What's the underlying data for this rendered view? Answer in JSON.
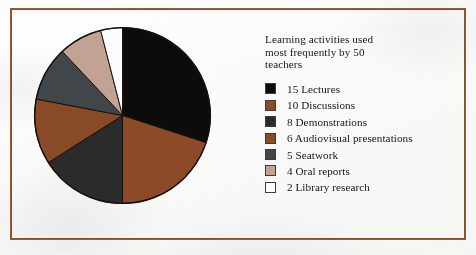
{
  "figure": {
    "frame_color": "#9a5a34",
    "page_background": "#fdfdfc"
  },
  "legend": {
    "title": "Learning activities used\nmost frequently by 50\nteachers"
  },
  "chart_data": {
    "type": "pie",
    "title": "Learning activities used most frequently by 50 teachers",
    "xlabel": "",
    "ylabel": "",
    "total": 50,
    "units": "teachers",
    "start_angle_deg": 0,
    "direction": "clockwise",
    "legend_position": "right",
    "grid": false,
    "categories": [
      "Lectures",
      "Discussions",
      "Demonstrations",
      "Audiovisual presentations",
      "Seatwork",
      "Oral reports",
      "Library research"
    ],
    "values": [
      15,
      10,
      8,
      6,
      5,
      4,
      2
    ],
    "colors": [
      "#0d0c0b",
      "#8d4a27",
      "#2b2b2c",
      "#8a4a27",
      "#41464a",
      "#c3a394",
      "#fdfdfb"
    ],
    "slices": [
      {
        "label": "Lectures",
        "value": 15,
        "legend_label": "15 Lectures",
        "color": "#0d0c0b",
        "percent": 30,
        "angle_deg": 108.0
      },
      {
        "label": "Discussions",
        "value": 10,
        "legend_label": "10  Discussions",
        "color": "#8d4a27",
        "percent": 20,
        "angle_deg": 72.0
      },
      {
        "label": "Demonstrations",
        "value": 8,
        "legend_label": "8 Demonstrations",
        "color": "#2b2b2c",
        "percent": 16,
        "angle_deg": 57.6
      },
      {
        "label": "Audiovisual presentations",
        "value": 6,
        "legend_label": "6 Audiovisual presentations",
        "color": "#8a4a27",
        "percent": 12,
        "angle_deg": 43.2
      },
      {
        "label": "Seatwork",
        "value": 5,
        "legend_label": "5 Seatwork",
        "color": "#41464a",
        "percent": 10,
        "angle_deg": 36.0
      },
      {
        "label": "Oral reports",
        "value": 4,
        "legend_label": "4 Oral reports",
        "color": "#c3a394",
        "percent": 8,
        "angle_deg": 28.8
      },
      {
        "label": "Library research",
        "value": 2,
        "legend_label": "2 Library research",
        "color": "#fdfdfb",
        "percent": 4,
        "angle_deg": 14.4
      }
    ]
  }
}
